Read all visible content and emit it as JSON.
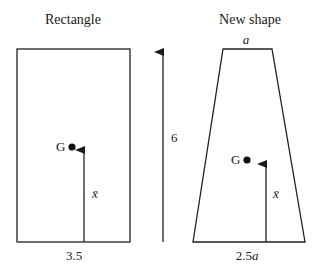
{
  "diagram": {
    "left_panel": {
      "title": "Rectangle",
      "width_label": "3.5",
      "centroid_label": "G",
      "centroid_height_label": "x̄"
    },
    "height_indicator": {
      "label": "6"
    },
    "right_panel": {
      "title": "New shape",
      "top_width_label": "a",
      "bottom_width_label": "2.5a",
      "bottom_width_number": "2.5",
      "bottom_width_var": "a",
      "centroid_label": "G",
      "centroid_height_label": "x̄"
    }
  }
}
